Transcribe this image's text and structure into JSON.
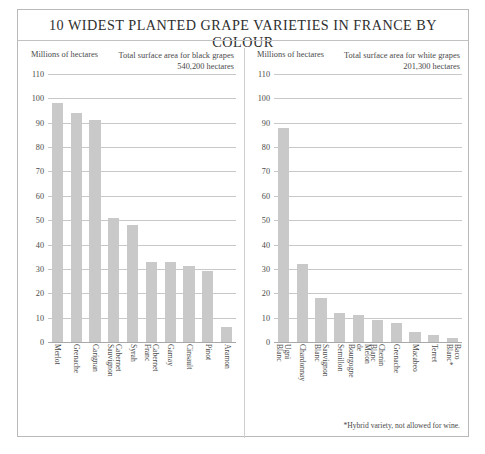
{
  "title": "10 WIDEST PLANTED GRAPE VARIETIES IN FRANCE BY COLOUR",
  "footnote": "*Hybrid variety, not allowed for wine.",
  "panels": {
    "black": {
      "units_label": "Millions of hectares",
      "area_caption": "Total surface area for black grapes",
      "area_value": "540,200 hectares"
    },
    "white": {
      "units_label": "Millions of hectares",
      "area_caption": "Total surface area for white grapes",
      "area_value": "201,300 hectares"
    }
  },
  "chart_data": [
    {
      "type": "bar",
      "title": "Total surface area for black grapes",
      "subtitle": "540,200 hectares",
      "xlabel": "",
      "ylabel": "Millions of hectares",
      "ylim": [
        0,
        110
      ],
      "yticks": [
        110,
        100,
        90,
        80,
        70,
        60,
        50,
        40,
        30,
        20,
        10,
        0
      ],
      "grid": true,
      "legend": "none",
      "bar_color": "#c9c9c9",
      "categories": [
        "Merlot",
        "Grenache",
        "Carignan",
        "Cabernet Sauvignon",
        "Syrah",
        "Cabernet Franc",
        "Gamay",
        "Cinsault",
        "Pinot",
        "Aramon"
      ],
      "values": [
        98,
        94,
        91,
        51,
        48,
        33,
        33,
        31,
        29,
        6
      ]
    },
    {
      "type": "bar",
      "title": "Total surface area for white grapes",
      "subtitle": "201,300 hectares",
      "xlabel": "",
      "ylabel": "Millions of hectares",
      "ylim": [
        0,
        110
      ],
      "yticks": [
        110,
        100,
        90,
        80,
        70,
        60,
        50,
        40,
        30,
        20,
        10,
        0
      ],
      "grid": true,
      "legend": "none",
      "bar_color": "#c9c9c9",
      "annotations": [
        "*Hybrid variety, not allowed for wine."
      ],
      "categories": [
        "Ugni Blanc",
        "Chardonnay",
        "Sauvignon Blanc",
        "Semillon",
        "Melon de Bourgogne",
        "Chenin Blanc",
        "Grenache",
        "Macabeo",
        "Terret",
        "Baco Blanc*"
      ],
      "values": [
        88,
        32,
        18,
        12,
        11,
        9,
        8,
        4,
        3,
        1.5
      ]
    }
  ]
}
